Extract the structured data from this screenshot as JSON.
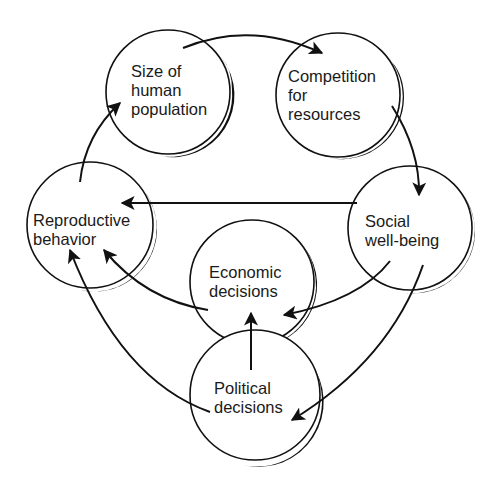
{
  "diagram": {
    "type": "cycle-flow",
    "background": "#ffffff",
    "ink": "#111111",
    "nodes": [
      {
        "id": "size",
        "lines": [
          "Size of",
          "human",
          "population"
        ]
      },
      {
        "id": "competition",
        "lines": [
          "Competition",
          "for",
          "resources"
        ]
      },
      {
        "id": "social",
        "lines": [
          "Social",
          "well-being"
        ]
      },
      {
        "id": "reproductive",
        "lines": [
          "Reproductive",
          "behavior"
        ]
      },
      {
        "id": "economic",
        "lines": [
          "Economic",
          "decisions"
        ]
      },
      {
        "id": "political",
        "lines": [
          "Political",
          "decisions"
        ]
      }
    ],
    "edges": [
      {
        "from": "size",
        "to": "competition"
      },
      {
        "from": "competition",
        "to": "social"
      },
      {
        "from": "social",
        "to": "reproductive"
      },
      {
        "from": "reproductive",
        "to": "size"
      },
      {
        "from": "social",
        "to": "economic"
      },
      {
        "from": "social",
        "to": "political"
      },
      {
        "from": "economic",
        "to": "reproductive"
      },
      {
        "from": "political",
        "to": "economic"
      },
      {
        "from": "political",
        "to": "reproductive"
      }
    ]
  }
}
